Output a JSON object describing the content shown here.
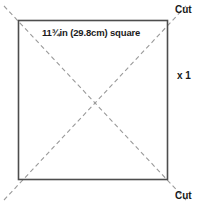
{
  "diagram": {
    "type": "fabric-cutting-square",
    "background_color": "#ffffff",
    "outline_color": "#4d4d4d",
    "fold_line_color": "#9a9a9a",
    "text_color": "#1a1a1a",
    "square": {
      "x": 18,
      "y": 20,
      "width": 150,
      "height": 160
    },
    "labels": {
      "dimension": "11¾in (29.8cm) square",
      "cut_top": "Cut",
      "cut_bottom": "Cut",
      "quantity": "x 1"
    },
    "diagonals": [
      {
        "name": "diagonal-tl-br",
        "x1": 4,
        "y1": 6,
        "x2": 186,
        "y2": 200
      },
      {
        "name": "diagonal-bl-tr",
        "x1": 4,
        "y1": 200,
        "x2": 186,
        "y2": 6
      }
    ]
  }
}
